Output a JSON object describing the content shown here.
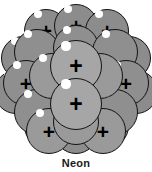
{
  "figure": {
    "caption": "Neon",
    "element_symbol": "Ne",
    "width": 152,
    "height": 172,
    "background_color": "#ffffff"
  },
  "colors": {
    "sphere_back": "#8c8c8c",
    "sphere_mid": "#8f8f8f",
    "sphere_front": "#9a9a9a",
    "sphere_center": "#a6a6a6",
    "outline": "#121212",
    "highlight": "#ffffff",
    "charge_mark": "#000000",
    "caption_text": "#1a1a1a"
  },
  "diagram": {
    "type": "atomic-nucleus-packing",
    "particle_label_proton": "+",
    "particle_label_neutron": "",
    "proton_count_visible": 10,
    "nucleon_count_visible": 23,
    "layers": [
      {
        "name": "back",
        "nucleons": [
          {
            "cx": 46,
            "cy": 31,
            "r": 22,
            "charge": "+",
            "plus_size": 20,
            "hl_x": 38,
            "hl_y": 14,
            "hl_r": 4.0
          },
          {
            "cx": 76,
            "cy": 26,
            "r": 22,
            "charge": "+",
            "plus_size": 20,
            "hl_x": 68,
            "hl_y": 9,
            "hl_r": 4.0
          },
          {
            "cx": 107,
            "cy": 31,
            "r": 22,
            "charge": "+",
            "plus_size": 20,
            "hl_x": 99,
            "hl_y": 14,
            "hl_r": 4.0
          },
          {
            "cx": 23,
            "cy": 58,
            "r": 22,
            "charge": "",
            "plus_size": 0,
            "hl_x": 15,
            "hl_y": 41,
            "hl_r": 4.0
          },
          {
            "cx": 129,
            "cy": 58,
            "r": 22,
            "charge": "",
            "plus_size": 0,
            "hl_x": 121,
            "hl_y": 41,
            "hl_r": 4.0
          },
          {
            "cx": 16,
            "cy": 92,
            "r": 22,
            "charge": "",
            "plus_size": 0,
            "hl_x": 8,
            "hl_y": 75,
            "hl_r": 4.0
          },
          {
            "cx": 136,
            "cy": 92,
            "r": 22,
            "charge": "",
            "plus_size": 0,
            "hl_x": 128,
            "hl_y": 75,
            "hl_r": 4.0
          },
          {
            "cx": 46,
            "cy": 126,
            "r": 22,
            "charge": "",
            "plus_size": 0,
            "hl_x": 38,
            "hl_y": 109,
            "hl_r": 4.0
          },
          {
            "cx": 76,
            "cy": 132,
            "r": 22,
            "charge": "",
            "plus_size": 0,
            "hl_x": 68,
            "hl_y": 115,
            "hl_r": 4.0
          },
          {
            "cx": 107,
            "cy": 126,
            "r": 22,
            "charge": "",
            "plus_size": 0,
            "hl_x": 99,
            "hl_y": 109,
            "hl_r": 4.0
          }
        ]
      },
      {
        "name": "mid",
        "nucleons": [
          {
            "cx": 37,
            "cy": 52,
            "r": 23,
            "charge": "",
            "plus_size": 0,
            "hl_x": 28,
            "hl_y": 34,
            "hl_r": 4.2
          },
          {
            "cx": 76,
            "cy": 48,
            "r": 23,
            "charge": "",
            "plus_size": 0,
            "hl_x": 67,
            "hl_y": 30,
            "hl_r": 4.2
          },
          {
            "cx": 115,
            "cy": 52,
            "r": 23,
            "charge": "",
            "plus_size": 0,
            "hl_x": 106,
            "hl_y": 34,
            "hl_r": 4.2
          },
          {
            "cx": 26,
            "cy": 83,
            "r": 23,
            "charge": "+",
            "plus_size": 21,
            "hl_x": 17,
            "hl_y": 65,
            "hl_r": 4.2
          },
          {
            "cx": 126,
            "cy": 83,
            "r": 23,
            "charge": "+",
            "plus_size": 21,
            "hl_x": 117,
            "hl_y": 65,
            "hl_r": 4.2
          },
          {
            "cx": 37,
            "cy": 112,
            "r": 23,
            "charge": "",
            "plus_size": 0,
            "hl_x": 28,
            "hl_y": 94,
            "hl_r": 4.2
          },
          {
            "cx": 115,
            "cy": 112,
            "r": 23,
            "charge": "",
            "plus_size": 0,
            "hl_x": 106,
            "hl_y": 94,
            "hl_r": 4.2
          }
        ]
      },
      {
        "name": "front",
        "nucleons": [
          {
            "cx": 52,
            "cy": 76,
            "r": 23,
            "charge": "",
            "plus_size": 0,
            "hl_x": 43,
            "hl_y": 58,
            "hl_r": 4.2
          },
          {
            "cx": 100,
            "cy": 76,
            "r": 23,
            "charge": "",
            "plus_size": 0,
            "hl_x": 91,
            "hl_y": 58,
            "hl_r": 4.2
          },
          {
            "cx": 49,
            "cy": 131,
            "r": 23,
            "charge": "+",
            "plus_size": 21,
            "hl_x": 40,
            "hl_y": 113,
            "hl_r": 4.2
          },
          {
            "cx": 103,
            "cy": 131,
            "r": 23,
            "charge": "+",
            "plus_size": 21,
            "hl_x": 94,
            "hl_y": 113,
            "hl_r": 4.2
          },
          {
            "cx": 76,
            "cy": 122,
            "r": 23,
            "charge": "+",
            "plus_size": 21,
            "hl_x": 67,
            "hl_y": 104,
            "hl_r": 4.2
          }
        ]
      },
      {
        "name": "center",
        "nucleons": [
          {
            "cx": 76,
            "cy": 66,
            "r": 26,
            "charge": "+",
            "plus_size": 23,
            "hl_x": 66,
            "hl_y": 46,
            "hl_r": 4.6
          },
          {
            "cx": 76,
            "cy": 104,
            "r": 26,
            "charge": "+",
            "plus_size": 23,
            "hl_x": 66,
            "hl_y": 84,
            "hl_r": 4.6
          }
        ]
      }
    ]
  }
}
